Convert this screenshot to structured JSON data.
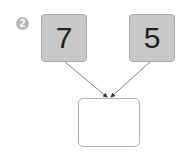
{
  "problem": {
    "number": "2",
    "left_value": "7",
    "right_value": "5",
    "answer_value": ""
  },
  "colors": {
    "box_fill": "#c8c8c8",
    "badge_fill": "#b8b8b8",
    "arrow": "#555555"
  }
}
